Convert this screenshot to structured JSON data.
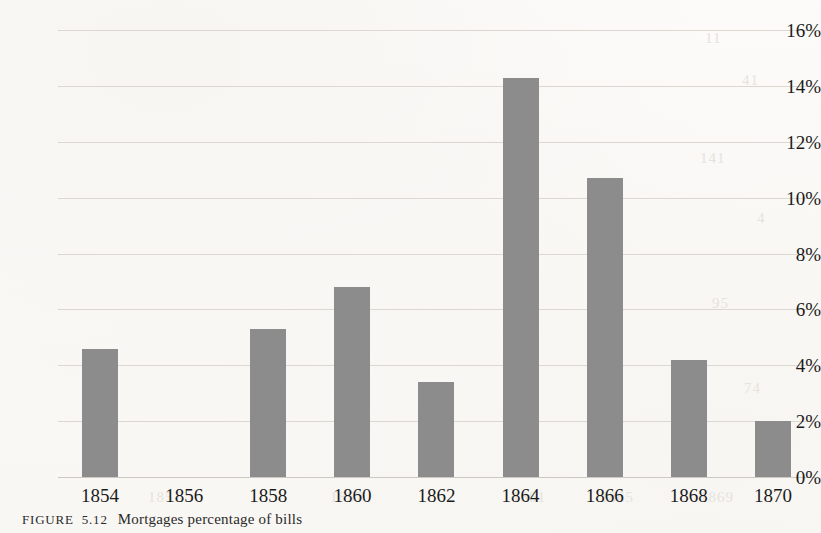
{
  "figure": {
    "caption_label": "FIGURE",
    "caption_number": "5.12",
    "caption_text": "Mortgages    percentage of bills",
    "bar_color": "#8c8c8c",
    "gridline_color": "#d9d6d0",
    "background_color": "#fbfaf8",
    "text_color": "#1b1b1b"
  },
  "chart_data": {
    "type": "bar",
    "title": "",
    "subtitle": "",
    "xlabel": "",
    "ylabel": "",
    "categories": [
      "1854",
      "1856",
      "1858",
      "1860",
      "1862",
      "1864",
      "1866",
      "1868",
      "1870"
    ],
    "values": [
      4.6,
      0,
      5.3,
      6.8,
      3.4,
      14.3,
      10.7,
      4.2,
      2.0
    ],
    "value_unit": "%",
    "ylim": [
      0,
      16
    ],
    "ytick_values": [
      0,
      2,
      4,
      6,
      8,
      10,
      12,
      14,
      16
    ],
    "ytick_labels": [
      "0%",
      "2%",
      "4%",
      "6%",
      "8%",
      "10%",
      "12%",
      "14%",
      "16%"
    ],
    "xtick_labels": [
      "1854",
      "1856",
      "1858",
      "1860",
      "1862",
      "1864",
      "1866",
      "1868",
      "1870"
    ],
    "grid": true,
    "grid_axis": "y",
    "legend": false,
    "legend_position": "none",
    "series": [
      {
        "name": "percentage of bills",
        "values": [
          4.6,
          0,
          5.3,
          6.8,
          3.4,
          14.3,
          10.7,
          4.2,
          2.0
        ]
      }
    ],
    "annotations": [
      "1856 has no bar (zero value)"
    ]
  },
  "ghost_marks": [
    {
      "text": "11",
      "x": 705,
      "y": 30
    },
    {
      "text": "41",
      "x": 742,
      "y": 72
    },
    {
      "text": "141",
      "x": 700,
      "y": 150
    },
    {
      "text": "4",
      "x": 757,
      "y": 210
    },
    {
      "text": "95",
      "x": 712,
      "y": 295
    },
    {
      "text": "74",
      "x": 744,
      "y": 380
    },
    {
      "text": "1851",
      "x": 148,
      "y": 489
    },
    {
      "text": "1857",
      "x": 330,
      "y": 489
    },
    {
      "text": "1861",
      "x": 512,
      "y": 489
    },
    {
      "text": "1865",
      "x": 600,
      "y": 489
    },
    {
      "text": "1869",
      "x": 700,
      "y": 489
    }
  ]
}
